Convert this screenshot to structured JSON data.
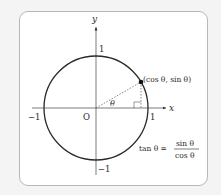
{
  "diagram": {
    "axes": {
      "x_label": "x",
      "y_label": "y",
      "origin_label": "O",
      "x_ticks": [
        "−1",
        "1"
      ],
      "y_ticks": [
        "1",
        "−1"
      ]
    },
    "angle_label": "θ",
    "point_label": "(cos θ, sin θ)",
    "formula": {
      "lhs": "tan θ =",
      "numerator": "sin θ",
      "denominator": "cos θ"
    },
    "colors": {
      "stroke": "#2a2a2a",
      "card_border": "#b8b8b8",
      "background": "#f4f4f4"
    }
  }
}
